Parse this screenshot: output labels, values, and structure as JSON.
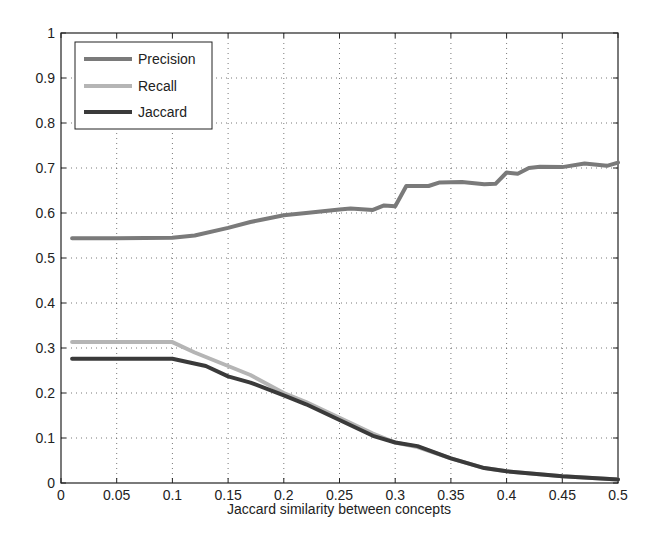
{
  "chart_data": {
    "type": "line",
    "title": "",
    "xlabel": "Jaccard similarity between concepts",
    "ylabel": "",
    "xlim": [
      0,
      0.5
    ],
    "ylim": [
      0,
      1
    ],
    "grid": true,
    "legend_position": "upper left",
    "x_ticks": [
      "0",
      "0.05",
      "0.1",
      "0.15",
      "0.2",
      "0.25",
      "0.3",
      "0.35",
      "0.4",
      "0.45",
      "0.5"
    ],
    "y_ticks": [
      "0",
      "0.1",
      "0.2",
      "0.3",
      "0.4",
      "0.5",
      "0.6",
      "0.7",
      "0.8",
      "0.9",
      "1"
    ],
    "series": [
      {
        "name": "Precision",
        "color": "#7a7a7a",
        "width": 4,
        "x": [
          0.01,
          0.05,
          0.1,
          0.12,
          0.15,
          0.17,
          0.18,
          0.2,
          0.22,
          0.25,
          0.26,
          0.28,
          0.29,
          0.3,
          0.31,
          0.33,
          0.34,
          0.36,
          0.38,
          0.39,
          0.4,
          0.41,
          0.42,
          0.43,
          0.45,
          0.47,
          0.49,
          0.5
        ],
        "values": [
          0.544,
          0.544,
          0.545,
          0.55,
          0.567,
          0.58,
          0.585,
          0.595,
          0.6,
          0.608,
          0.61,
          0.607,
          0.617,
          0.615,
          0.66,
          0.66,
          0.668,
          0.669,
          0.664,
          0.665,
          0.69,
          0.687,
          0.7,
          0.703,
          0.702,
          0.71,
          0.705,
          0.712
        ]
      },
      {
        "name": "Recall",
        "color": "#b5b5b5",
        "width": 4,
        "x": [
          0.01,
          0.05,
          0.1,
          0.12,
          0.15,
          0.17,
          0.2,
          0.22,
          0.25,
          0.28,
          0.3,
          0.32,
          0.35,
          0.38,
          0.4,
          0.45,
          0.5
        ],
        "values": [
          0.313,
          0.313,
          0.313,
          0.29,
          0.26,
          0.24,
          0.2,
          0.18,
          0.145,
          0.11,
          0.09,
          0.08,
          0.055,
          0.033,
          0.026,
          0.015,
          0.008
        ]
      },
      {
        "name": "Jaccard",
        "color": "#3a3a3a",
        "width": 4,
        "x": [
          0.01,
          0.05,
          0.1,
          0.13,
          0.15,
          0.17,
          0.2,
          0.22,
          0.25,
          0.28,
          0.3,
          0.32,
          0.35,
          0.38,
          0.4,
          0.45,
          0.5
        ],
        "values": [
          0.276,
          0.276,
          0.276,
          0.26,
          0.237,
          0.223,
          0.195,
          0.175,
          0.14,
          0.105,
          0.09,
          0.082,
          0.055,
          0.033,
          0.026,
          0.015,
          0.008
        ]
      }
    ]
  }
}
